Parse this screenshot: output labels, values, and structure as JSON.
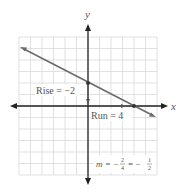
{
  "figure": {
    "type": "coordinate-plane-line",
    "axes": {
      "x_label": "x",
      "y_label": "y"
    },
    "grid": {
      "x_min": -6,
      "x_max": 6,
      "y_min": -6,
      "y_max": 6,
      "cell_px": 11.5
    },
    "line": {
      "slope": -0.5,
      "y_intercept": 2,
      "x_intercept": 4,
      "points": [
        [
          0,
          2
        ],
        [
          4,
          0
        ]
      ],
      "color": "#6b6b6b"
    },
    "annotations": {
      "rise": "Rise = −2",
      "run": "Run = 4",
      "slope_prefix": "m = −",
      "slope_frac1_num": "2",
      "slope_frac1_den": "4",
      "slope_eq": "= −",
      "slope_frac2_num": "1",
      "slope_frac2_den": "2"
    }
  }
}
